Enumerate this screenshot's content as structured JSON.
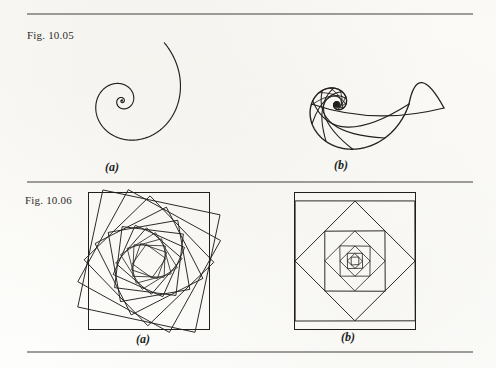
{
  "page": {
    "background_color": "#fdfdfb",
    "ink_color": "#231f1d",
    "width": 496,
    "height": 368
  },
  "rules": [
    {
      "name": "top-rule",
      "y": 14,
      "x1": 27,
      "x2": 473
    },
    {
      "name": "middle-rule",
      "y": 182,
      "x1": 27,
      "x2": 473
    },
    {
      "name": "bottom-rule",
      "y": 352,
      "x1": 27,
      "x2": 473
    }
  ],
  "figures": [
    {
      "id": "fig-1005",
      "label": "Fig. 10.05",
      "panels": [
        {
          "id": "fig-1005-a",
          "caption": "(a)",
          "kind": "logarithmic-spiral",
          "center": [
            122,
            101
          ],
          "outer_radius": 72,
          "turns": 3.15,
          "growth": 0.255,
          "start_angle_deg": 0,
          "direction": "counterclockwise",
          "open_end_direction": "east",
          "has_frame": false
        },
        {
          "id": "fig-1005-b",
          "caption": "(b)",
          "kind": "nautilus-shell-section",
          "center": [
            337,
            104
          ],
          "outer_radius": 72,
          "turns": 3.0,
          "growth": 0.33,
          "chamber_walls": 30,
          "aperture_tip": [
            444,
            108
          ],
          "has_frame": false
        }
      ]
    },
    {
      "id": "fig-1006",
      "label": "Fig. 10.06",
      "panels": [
        {
          "id": "fig-1006-a",
          "caption": "(a)",
          "kind": "rotating-inscribed-squares",
          "frame": {
            "x": 88,
            "y": 192,
            "width": 122,
            "height": 138
          },
          "square_count": 13,
          "step_angle_deg": 17,
          "shrink_ratio": 0.875,
          "initial_angle_deg": 12
        },
        {
          "id": "fig-1006-b",
          "caption": "(b)",
          "kind": "midpoint-inscribed-squares",
          "frame": {
            "x": 294,
            "y": 192,
            "width": 122,
            "height": 138
          },
          "square_count": 9,
          "step_angle_deg": 45,
          "shrink_ratio": 0.7071,
          "initial_angle_deg": 0
        }
      ]
    }
  ]
}
